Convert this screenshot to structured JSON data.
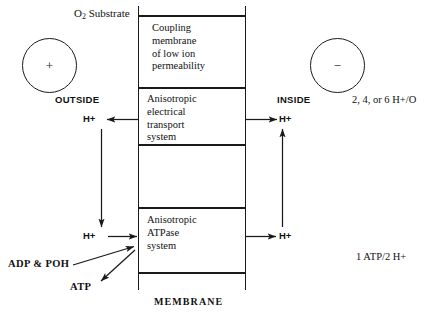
{
  "diagram": {
    "caption": "MEMBRANE",
    "top_left_label": "O",
    "top_left_sub": "2",
    "top_left_rest": " Substrate",
    "outside_label": "OUTSIDE",
    "inside_label": "INSIDE",
    "positive_charge": "+",
    "negative_charge": "−",
    "stoichiometry_top": "2, 4, or 6 H+/O",
    "stoichiometry_bottom": "1 ATP/2 H+",
    "adp_label": "ADP & POH",
    "atp_label": "ATP",
    "proton_labels": {
      "outside_top": "H+",
      "outside_bottom": "H+",
      "inside_top": "H+",
      "inside_bottom": "H+"
    },
    "compartments": [
      {
        "name": "coupling-membrane",
        "text": "Coupling\nmembrane\nof low ion\npermeability"
      },
      {
        "name": "electron-transport",
        "text": "Anisotropic\nelectrical\ntransport\nsystem"
      },
      {
        "name": "empty-compartment",
        "text": ""
      },
      {
        "name": "atpase",
        "text": "Anisotropic\nATPase\nsystem"
      }
    ],
    "colors": {
      "line": "#1a1a1a",
      "text": "#111111",
      "background": "#ffffff"
    }
  }
}
